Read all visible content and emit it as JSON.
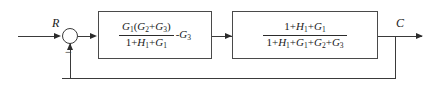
{
  "diagram": {
    "type": "control-system-block-diagram",
    "input_label": "R",
    "output_label": "C",
    "summing_junction": {
      "name": "summing-junction",
      "input_signs": [
        "+",
        "-"
      ],
      "feedback_sign": "−"
    },
    "blocks": [
      {
        "id": "block-1",
        "numerator": "G1(G2+G3)",
        "denominator": "1+H1+G1",
        "trailing_term": "-G3",
        "numerator_parts": [
          {
            "t": "G",
            "s": "1"
          },
          {
            "t": "(",
            "s": ""
          },
          {
            "t": "G",
            "s": "2"
          },
          {
            "t": "+",
            "s": ""
          },
          {
            "t": "G",
            "s": "3"
          },
          {
            "t": ")",
            "s": ""
          }
        ],
        "denominator_parts": [
          {
            "t": "1",
            "s": ""
          },
          {
            "t": "+",
            "s": ""
          },
          {
            "t": "H",
            "s": "1"
          },
          {
            "t": "+",
            "s": ""
          },
          {
            "t": "G",
            "s": "1"
          }
        ]
      },
      {
        "id": "block-2",
        "numerator": "1+H1+G1",
        "denominator": "1+H1+G1+G2+G3",
        "trailing_term": "",
        "numerator_parts": [
          {
            "t": "1",
            "s": ""
          },
          {
            "t": "+",
            "s": ""
          },
          {
            "t": "H",
            "s": "1"
          },
          {
            "t": "+",
            "s": ""
          },
          {
            "t": "G",
            "s": "1"
          }
        ],
        "denominator_parts": [
          {
            "t": "1",
            "s": ""
          },
          {
            "t": "+",
            "s": ""
          },
          {
            "t": "H",
            "s": "1"
          },
          {
            "t": "+",
            "s": ""
          },
          {
            "t": "G",
            "s": "1"
          },
          {
            "t": "+",
            "s": ""
          },
          {
            "t": "G",
            "s": "2"
          },
          {
            "t": "+",
            "s": ""
          },
          {
            "t": "G",
            "s": "3"
          }
        ]
      }
    ],
    "feedback_path": {
      "name": "unity-feedback-path",
      "label": ""
    },
    "colors": {
      "line": "#3a3a3a",
      "block_border": "#4a4a4a",
      "text": "#1a1a1a",
      "background": "#ffffff"
    }
  }
}
